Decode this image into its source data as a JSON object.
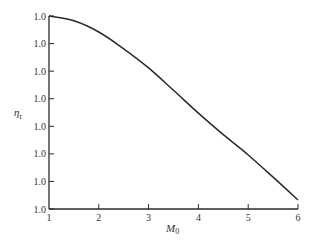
{
  "chart_data": {
    "type": "line",
    "title": "",
    "xlabel": "M_0",
    "ylabel": "η_r",
    "x_ticks": [
      1,
      2,
      3,
      4,
      5,
      6
    ],
    "y_tick_labels": [
      "1.0",
      "1.0",
      "1.0",
      "1.0",
      "1.0",
      "1.0",
      "1.0",
      "1.0"
    ],
    "xlim": [
      1,
      6
    ],
    "ylim_normalized": [
      0,
      1
    ],
    "grid": false,
    "legend": null,
    "series": [
      {
        "name": "η_r",
        "x": [
          1,
          1.5,
          2,
          2.5,
          3,
          3.5,
          4,
          4.5,
          5,
          5.5,
          6
        ],
        "values_normalized": [
          1.0,
          0.975,
          0.917,
          0.83,
          0.731,
          0.615,
          0.497,
          0.385,
          0.28,
          0.165,
          0.047
        ]
      }
    ],
    "note": "All y-axis tick labels are printed as '1.0' in the source; values are expressed as normalized axis fractions (0 = bottom tick, 1 = top tick)."
  },
  "labels": {
    "xlabel_main": "M",
    "xlabel_sub": "0",
    "ylabel_main": "η",
    "ylabel_sub": "r"
  }
}
